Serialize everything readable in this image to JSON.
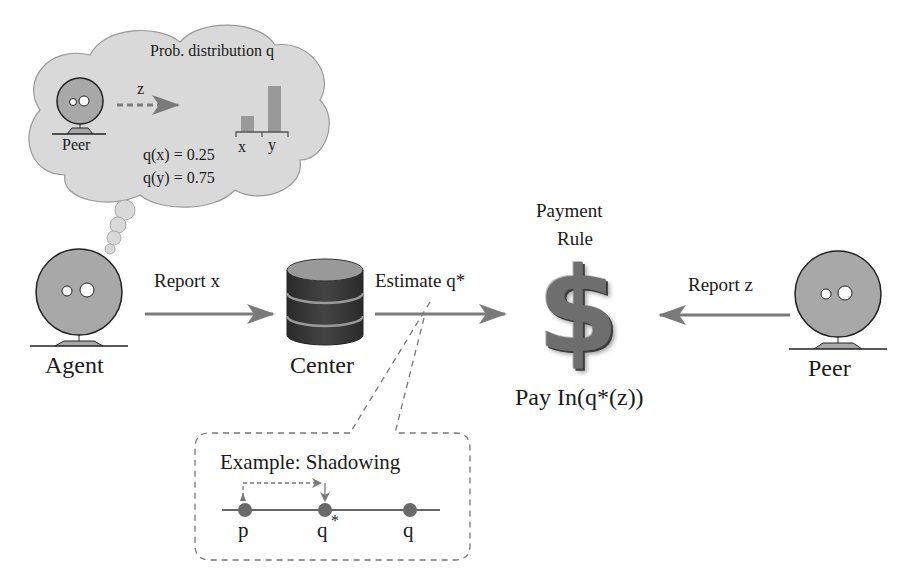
{
  "thought_cloud": {
    "title": "Prob. distribution q",
    "peer_label": "Peer",
    "arrow_label": "z",
    "bar_labels": [
      "x",
      "y"
    ],
    "formula_x": "q(x) = 0.25",
    "formula_y": "q(y) = 0.75"
  },
  "agent": {
    "label": "Agent"
  },
  "arrow_report_x": {
    "label": "Report x"
  },
  "center": {
    "label": "Center"
  },
  "arrow_estimate": {
    "label": "Estimate q*"
  },
  "payment": {
    "title_line1": "Payment",
    "title_line2": "Rule",
    "symbol": "$",
    "pay_label": "Pay In(q*(z))"
  },
  "arrow_report_z": {
    "label": "Report z"
  },
  "peer": {
    "label": "Peer"
  },
  "example_box": {
    "title": "Example: Shadowing",
    "points": [
      "p",
      "q",
      "q"
    ],
    "superscript": "*"
  },
  "colors": {
    "cloud_fill": "#d9d9d9",
    "head_fill": "#a8a8a8",
    "arrow": "#7a7a7a",
    "database": "#3a3a3a",
    "dot": "#6a6a6a"
  }
}
